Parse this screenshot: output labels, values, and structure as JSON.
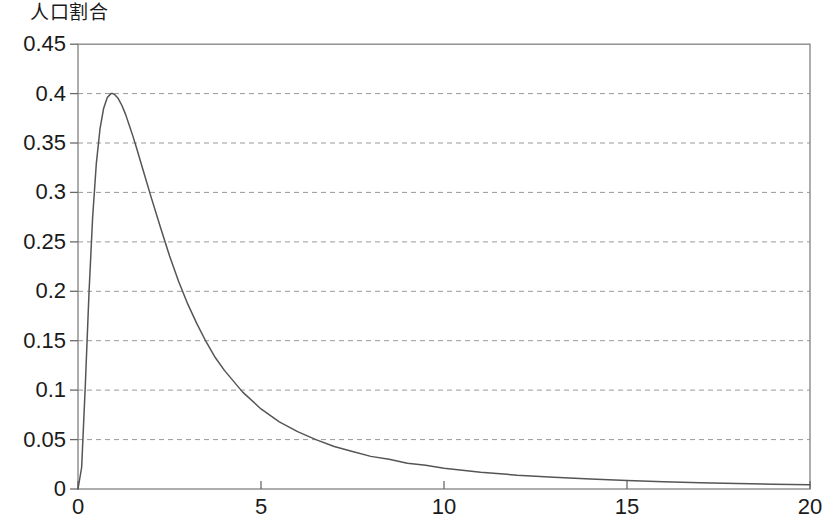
{
  "chart_data": {
    "type": "line",
    "title": "人口割合",
    "title_position": "top-left-above-y-axis",
    "xlabel": "",
    "ylabel": "人口割合",
    "xlim": [
      0,
      20
    ],
    "ylim": [
      0,
      0.45
    ],
    "grid": "horizontal-dashed",
    "legend": "none",
    "line_color": "#555555",
    "grid_color": "#999999",
    "frame_color": "#888888",
    "x_ticks": [
      0,
      5,
      10,
      15,
      20
    ],
    "x_tick_labels": [
      "0",
      "5",
      "10",
      "15",
      "20"
    ],
    "y_ticks": [
      0,
      0.05,
      0.1,
      0.15,
      0.2,
      0.25,
      0.3,
      0.35,
      0.4,
      0.45
    ],
    "y_tick_labels": [
      "0",
      "0.05",
      "0.1",
      "0.15",
      "0.2",
      "0.25",
      "0.3",
      "0.35",
      "0.4",
      "0.45"
    ],
    "series": [
      {
        "name": "人口割合",
        "x": [
          0,
          0.1,
          0.2,
          0.3,
          0.4,
          0.5,
          0.6,
          0.7,
          0.8,
          0.9,
          0.95,
          1.0,
          1.1,
          1.2,
          1.3,
          1.4,
          1.5,
          1.6,
          1.8,
          2.0,
          2.25,
          2.5,
          2.75,
          3.0,
          3.25,
          3.5,
          3.75,
          4.0,
          4.5,
          5.0,
          5.5,
          6.0,
          6.5,
          7.0,
          7.5,
          8.0,
          8.5,
          9.0,
          9.5,
          10.0,
          11.0,
          12.0,
          13.0,
          14.0,
          15.0,
          16.0,
          17.0,
          18.0,
          19.0,
          20.0
        ],
        "y": [
          0.0,
          0.022,
          0.105,
          0.198,
          0.275,
          0.329,
          0.364,
          0.385,
          0.396,
          0.4,
          0.4,
          0.399,
          0.395,
          0.388,
          0.379,
          0.368,
          0.357,
          0.345,
          0.32,
          0.295,
          0.265,
          0.236,
          0.21,
          0.187,
          0.167,
          0.149,
          0.133,
          0.12,
          0.098,
          0.081,
          0.068,
          0.058,
          0.05,
          0.043,
          0.038,
          0.033,
          0.03,
          0.026,
          0.024,
          0.021,
          0.017,
          0.014,
          0.012,
          0.01,
          0.0085,
          0.0073,
          0.0063,
          0.0055,
          0.0048,
          0.0042
        ]
      }
    ],
    "annotations": {
      "peak_value": 0.4,
      "peak_x": 0.95,
      "description": "右に裾を引く単峰型分布曲線"
    }
  },
  "axis": {
    "title": "人口割合"
  }
}
